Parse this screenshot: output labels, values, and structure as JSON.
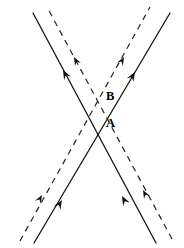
{
  "figure": {
    "background_color": "#ffffff",
    "width": 184,
    "height": 248,
    "labels": [
      {
        "id": "label-b",
        "text": "B",
        "x": 106,
        "y": 97
      },
      {
        "id": "label-a",
        "text": "A",
        "x": 106,
        "y": 124
      }
    ],
    "intersections": [
      {
        "id": "point-b",
        "label": "B",
        "x": 98,
        "y": 97,
        "lines": "dashed-pair"
      },
      {
        "id": "point-a",
        "label": "A",
        "x": 98,
        "y": 122,
        "lines": "solid-pair"
      }
    ],
    "lines": [
      {
        "id": "solid-up-right",
        "style": "solid",
        "stroke": "#1a1a1a",
        "x1": 34,
        "y1": 243,
        "x2": 170,
        "y2": 13,
        "direction": "up-right"
      },
      {
        "id": "solid-up-left",
        "style": "solid",
        "stroke": "#1a1a1a",
        "x1": 156,
        "y1": 243,
        "x2": 33,
        "y2": 13,
        "direction": "up-left"
      },
      {
        "id": "dashed-up-right",
        "style": "dashed",
        "stroke": "#2a2a2a",
        "x1": 20,
        "y1": 241,
        "x2": 150,
        "y2": 7,
        "direction": "up-right"
      },
      {
        "id": "dashed-up-left",
        "style": "dashed",
        "stroke": "#2a2a2a",
        "x1": 172,
        "y1": 239,
        "x2": 47,
        "y2": 7,
        "direction": "up-left"
      }
    ],
    "arrows": [
      {
        "id": "arrow-solid-up-left-top",
        "on": "solid-up-left",
        "x": 63,
        "y": 70,
        "angle": 242,
        "size": 9.5
      },
      {
        "id": "arrow-dashed-up-left-top",
        "on": "dashed-up-left",
        "x": 74,
        "y": 57,
        "angle": 242,
        "size": 8.5
      },
      {
        "id": "arrow-solid-up-right-top",
        "on": "solid-up-right",
        "x": 135,
        "y": 72,
        "angle": 301,
        "size": 9.5
      },
      {
        "id": "arrow-dashed-up-right-top",
        "on": "dashed-up-right",
        "x": 124,
        "y": 57,
        "angle": 299,
        "size": 8.5
      },
      {
        "id": "arrow-solid-up-right-bot",
        "on": "solid-up-right",
        "x": 62,
        "y": 200,
        "angle": 301,
        "size": 9.5
      },
      {
        "id": "arrow-dashed-up-right-bot",
        "on": "dashed-up-right",
        "x": 42,
        "y": 195,
        "angle": 299,
        "size": 8.5
      },
      {
        "id": "arrow-solid-up-left-bot",
        "on": "solid-up-left",
        "x": 122,
        "y": 196,
        "angle": 242,
        "size": 9.5
      },
      {
        "id": "arrow-dashed-up-left-bot",
        "on": "dashed-up-left",
        "x": 143,
        "y": 190,
        "angle": 242,
        "size": 8.5
      }
    ]
  }
}
